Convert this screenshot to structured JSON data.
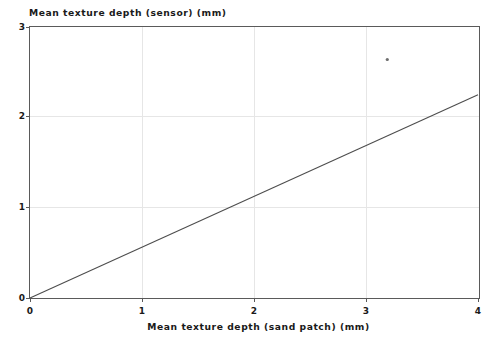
{
  "chart_data": {
    "type": "line",
    "title": "",
    "xlabel": "Mean texture depth (sand patch) (mm)",
    "ylabel": "Mean texture depth (sensor) (mm)",
    "xlim": [
      0,
      4
    ],
    "ylim": [
      0,
      3
    ],
    "xticks": [
      "0",
      "1",
      "2",
      "3",
      "4"
    ],
    "yticks": [
      "0",
      "1",
      "2",
      "3"
    ],
    "xtick_values": [
      0,
      1,
      2,
      3,
      4
    ],
    "ytick_values": [
      0,
      1,
      2,
      3
    ],
    "grid": true,
    "legend": "none",
    "series": [
      {
        "name": "regression-line",
        "type": "line",
        "x": [
          0,
          4
        ],
        "values": [
          0,
          2.25
        ],
        "slope": 0.5625,
        "intercept": 0,
        "color": "#4d4d4d"
      },
      {
        "name": "outlier-point",
        "type": "scatter",
        "x": [
          3.19
        ],
        "values": [
          2.64
        ],
        "color": "#6e6e6e"
      }
    ]
  },
  "axes": {
    "y_title": "Mean texture depth (sensor) (mm)",
    "x_title": "Mean texture depth (sand patch) (mm)",
    "y_tick_0": "0",
    "y_tick_1": "1",
    "y_tick_2": "2",
    "y_tick_3": "3",
    "x_tick_0": "0",
    "x_tick_1": "1",
    "x_tick_2": "2",
    "x_tick_3": "3",
    "x_tick_4": "4"
  },
  "colors": {
    "frame": "#5a5a5a",
    "grid": "#e6e6e6",
    "line": "#4d4d4d",
    "marker": "#6e6e6e",
    "background": "#ffffff",
    "text": "#1a1a1a"
  }
}
